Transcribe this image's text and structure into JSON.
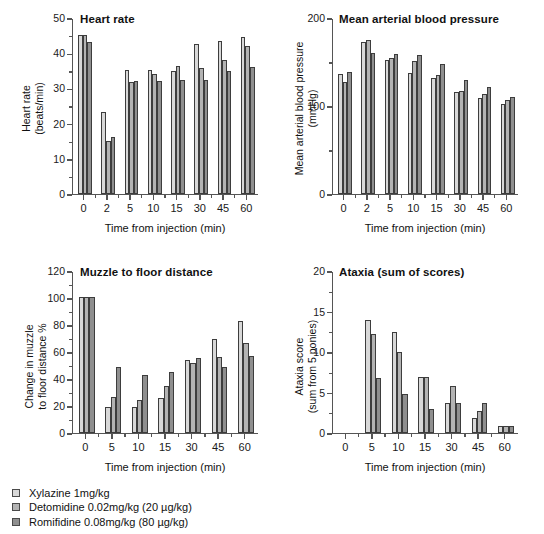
{
  "figure": {
    "series": [
      {
        "name": "Xylazine 1mg/kg",
        "color": "#d8d8d8"
      },
      {
        "name": "Detomidine 0.02mg/kg (20 µg/kg)",
        "color": "#b3b3b3"
      },
      {
        "name": "Romifidine 0.08mg/kg (80 µg/kg)",
        "color": "#8f8f8f"
      }
    ],
    "legend": [
      {
        "label": "Xylazine 1mg/kg",
        "swatch": "#d8d8d8"
      },
      {
        "label": "Detomidine 0.02mg/kg (20 µg/kg)",
        "swatch": "#b3b3b3"
      },
      {
        "label": "Romifidine 0.08mg/kg (80 µg/kg)",
        "swatch": "#8f8f8f"
      }
    ]
  },
  "chart_data": [
    {
      "id": "heart-rate",
      "type": "bar",
      "title": "Heart rate",
      "xlabel": "Time from injection (min)",
      "ylabel": "Heart rate\n(beats/min)",
      "ylabel_line1": "Heart rate",
      "ylabel_line2": "(beats/min)",
      "categories": [
        "0",
        "2",
        "5",
        "10",
        "15",
        "30",
        "45",
        "60"
      ],
      "ylim": [
        0,
        50
      ],
      "yticks": [
        0,
        10,
        20,
        30,
        40,
        50
      ],
      "yticks_minor": [
        5,
        15,
        25,
        35,
        45
      ],
      "grid": false,
      "legend_position": "below-figure",
      "series": [
        {
          "name": "Xylazine 1mg/kg",
          "values": [
            45.0,
            23.3,
            35.2,
            35.2,
            34.9,
            42.5,
            43.4,
            44.4
          ]
        },
        {
          "name": "Detomidine 0.02mg/kg (20 µg/kg)",
          "values": [
            45.0,
            15.0,
            31.8,
            34.0,
            36.3,
            35.7,
            38.0,
            41.8
          ]
        },
        {
          "name": "Romifidine 0.08mg/kg (80 µg/kg)",
          "values": [
            43.2,
            16.0,
            31.9,
            32.1,
            32.2,
            32.2,
            34.8,
            36.0
          ]
        }
      ]
    },
    {
      "id": "blood-pressure",
      "type": "bar",
      "title": "Mean arterial blood pressure",
      "xlabel": "Time from injection (min)",
      "ylabel_line1": "Mean arterial blood pressure",
      "ylabel_line2": "(mmHg)",
      "categories": [
        "0",
        "2",
        "5",
        "10",
        "15",
        "30",
        "45",
        "60"
      ],
      "ylim": [
        0,
        200
      ],
      "yticks": [
        0,
        100,
        200
      ],
      "yticks_minor": [
        50,
        150
      ],
      "grid": false,
      "series": [
        {
          "name": "Xylazine 1mg/kg",
          "values": [
            136,
            172,
            152,
            137,
            131,
            115,
            109,
            102
          ]
        },
        {
          "name": "Detomidine 0.02mg/kg (20 µg/kg)",
          "values": [
            127,
            175,
            154,
            151,
            135,
            117,
            113,
            106
          ]
        },
        {
          "name": "Romifidine 0.08mg/kg (80 µg/kg)",
          "values": [
            138,
            160,
            159,
            157,
            147,
            129,
            121,
            110
          ]
        }
      ]
    },
    {
      "id": "muzzle-to-floor",
      "type": "bar",
      "title": "Muzzle to floor distance",
      "xlabel": "Time from injection (min)",
      "ylabel_line1": "Change in muzzle",
      "ylabel_line2": "to floor distance %",
      "categories": [
        "0",
        "5",
        "10",
        "15",
        "30",
        "45",
        "60"
      ],
      "ylim": [
        0,
        120
      ],
      "yticks": [
        0,
        20,
        40,
        60,
        80,
        100,
        120
      ],
      "yticks_minor": [
        10,
        30,
        50,
        70,
        90,
        110
      ],
      "grid": false,
      "series": [
        {
          "name": "Xylazine 1mg/kg",
          "values": [
            100.5,
            18.8,
            18.8,
            25.8,
            53.8,
            69.3,
            83.0
          ]
        },
        {
          "name": "Detomidine 0.02mg/kg (20 µg/kg)",
          "values": [
            100.5,
            26.5,
            24.3,
            34.2,
            51.6,
            56.1,
            66.4
          ]
        },
        {
          "name": "Romifidine 0.08mg/kg (80 µg/kg)",
          "values": [
            100.5,
            48.6,
            42.8,
            45.2,
            55.1,
            48.7,
            56.8
          ]
        }
      ]
    },
    {
      "id": "ataxia",
      "type": "bar",
      "title": "Ataxia (sum of scores)",
      "xlabel": "Time from injection (min)",
      "ylabel_line1": "Ataxia score",
      "ylabel_line2": "(sum from 5 ponies)",
      "categories": [
        "0",
        "5",
        "10",
        "15",
        "30",
        "45",
        "60"
      ],
      "ylim": [
        0,
        20
      ],
      "yticks": [
        0,
        5,
        10,
        15,
        20
      ],
      "yticks_minor": [
        2.5,
        7.5,
        12.5,
        17.5
      ],
      "grid": false,
      "series": [
        {
          "name": "Xylazine 1mg/kg",
          "values": [
            0,
            13.9,
            12.4,
            6.9,
            3.7,
            1.8,
            0.8
          ]
        },
        {
          "name": "Detomidine 0.02mg/kg (20 µg/kg)",
          "values": [
            0,
            12.2,
            9.9,
            6.9,
            5.8,
            2.7,
            0.8
          ]
        },
        {
          "name": "Romifidine 0.08mg/kg (80 µg/kg)",
          "values": [
            0,
            6.7,
            4.8,
            2.9,
            3.7,
            3.7,
            0.8
          ]
        }
      ]
    }
  ]
}
